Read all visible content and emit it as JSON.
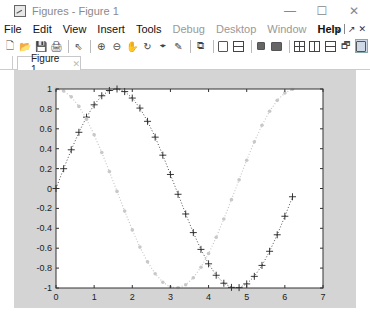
{
  "window": {
    "title": "Figures - Figure 1",
    "controls": {
      "minimize": "—",
      "maximize": "☐",
      "close": "✕"
    }
  },
  "menubar": {
    "items": [
      {
        "label": "File",
        "state": "normal"
      },
      {
        "label": "Edit",
        "state": "normal"
      },
      {
        "label": "View",
        "state": "normal"
      },
      {
        "label": "Insert",
        "state": "normal"
      },
      {
        "label": "Tools",
        "state": "normal"
      },
      {
        "label": "Debug",
        "state": "disabled"
      },
      {
        "label": "Desktop",
        "state": "disabled"
      },
      {
        "label": "Window",
        "state": "disabled"
      },
      {
        "label": "Help",
        "state": "bold"
      }
    ],
    "dock_controls": {
      "undock": "↘",
      "float": "↗",
      "close": "✕"
    }
  },
  "toolbar": {
    "buttons": [
      {
        "icon": "new-figure-icon",
        "glyph": "🗋"
      },
      {
        "icon": "open-file-icon",
        "glyph": "📂"
      },
      {
        "icon": "save-icon",
        "glyph": "💾"
      },
      {
        "icon": "print-icon",
        "glyph": "🖨"
      },
      {
        "icon": "edit-plot-icon",
        "glyph": "⇖"
      },
      {
        "icon": "zoom-in-icon",
        "glyph": "⊕"
      },
      {
        "icon": "zoom-out-icon",
        "glyph": "⊖"
      },
      {
        "icon": "pan-icon",
        "glyph": "✋"
      },
      {
        "icon": "rotate-3d-icon",
        "glyph": "↻"
      },
      {
        "icon": "data-cursor-icon",
        "glyph": "⌖"
      },
      {
        "icon": "brush-icon",
        "glyph": "✎"
      },
      {
        "icon": "link-plot-icon",
        "glyph": "⧉"
      },
      {
        "icon": "insert-colorbar-icon"
      },
      {
        "icon": "insert-legend-icon"
      },
      {
        "icon": "hide-plot-tools-icon"
      },
      {
        "icon": "show-plot-tools-icon"
      },
      {
        "icon": "tile-2x2-icon"
      },
      {
        "icon": "tile-left-right-icon"
      },
      {
        "icon": "tile-top-bottom-icon"
      },
      {
        "icon": "float-icon",
        "glyph": "🗗"
      },
      {
        "icon": "maximize-figure-icon"
      }
    ]
  },
  "tabs": [
    {
      "label": "Figure 1",
      "close": "✕",
      "active": true
    }
  ],
  "colors": {
    "figure_bg": "#d4d4d4",
    "axes_bg": "#ffffff",
    "series1": "#222222",
    "series2": "#c8c8c8"
  },
  "chart_data": {
    "type": "line",
    "title": "",
    "xlabel": "",
    "ylabel": "",
    "xlim": [
      0,
      7
    ],
    "ylim": [
      -1,
      1
    ],
    "xticks": [
      "0",
      "1",
      "2",
      "3",
      "4",
      "5",
      "6",
      "7"
    ],
    "yticks": [
      "-1",
      "-0.8",
      "-0.6",
      "-0.4",
      "-0.2",
      "0",
      "0.2",
      "0.4",
      "0.6",
      "0.8",
      "1"
    ],
    "grid": false,
    "legend": null,
    "x": [
      0,
      0.2,
      0.4,
      0.6,
      0.8,
      1.0,
      1.2,
      1.4,
      1.6,
      1.8,
      2.0,
      2.2,
      2.4,
      2.6,
      2.8,
      3.0,
      3.2,
      3.4,
      3.6,
      3.8,
      4.0,
      4.2,
      4.4,
      4.6,
      4.8,
      5.0,
      5.2,
      5.4,
      5.6,
      5.8,
      6.0,
      6.2
    ],
    "series": [
      {
        "name": "sin(x)",
        "marker": "+",
        "linestyle": "dotted",
        "color": "#222222",
        "values": [
          0,
          0.199,
          0.389,
          0.565,
          0.717,
          0.841,
          0.932,
          0.985,
          1.0,
          0.974,
          0.909,
          0.808,
          0.675,
          0.516,
          0.335,
          0.141,
          -0.058,
          -0.256,
          -0.443,
          -0.612,
          -0.757,
          -0.872,
          -0.952,
          -0.994,
          -0.996,
          -0.959,
          -0.883,
          -0.773,
          -0.631,
          -0.465,
          -0.279,
          -0.083
        ]
      },
      {
        "name": "cos(x)",
        "marker": ".",
        "linestyle": "dotted",
        "color": "#c8c8c8",
        "values": [
          1.0,
          0.98,
          0.921,
          0.825,
          0.697,
          0.54,
          0.362,
          0.17,
          -0.029,
          -0.227,
          -0.416,
          -0.589,
          -0.737,
          -0.857,
          -0.942,
          -0.99,
          -0.998,
          -0.967,
          -0.897,
          -0.791,
          -0.654,
          -0.49,
          -0.307,
          -0.112,
          0.087,
          0.284,
          0.469,
          0.635,
          0.776,
          0.886,
          0.96,
          0.997
        ]
      }
    ]
  }
}
